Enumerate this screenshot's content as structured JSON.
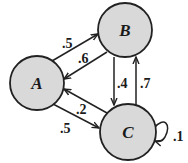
{
  "diagram": {
    "type": "markov-chain",
    "nodes": [
      {
        "id": "A",
        "label": "A"
      },
      {
        "id": "B",
        "label": "B"
      },
      {
        "id": "C",
        "label": "C"
      }
    ],
    "edges": [
      {
        "from": "A",
        "to": "B",
        "label": ".5"
      },
      {
        "from": "B",
        "to": "A",
        "label": ".6"
      },
      {
        "from": "B",
        "to": "C",
        "label": ".4"
      },
      {
        "from": "C",
        "to": "B",
        "label": ".7"
      },
      {
        "from": "C",
        "to": "A",
        "label": ".2"
      },
      {
        "from": "A",
        "to": "C",
        "label": ".5"
      },
      {
        "from": "C",
        "to": "C",
        "label": ".1"
      }
    ],
    "colors": {
      "node_fill": "#d9d9d9",
      "stroke": "#222222"
    }
  }
}
